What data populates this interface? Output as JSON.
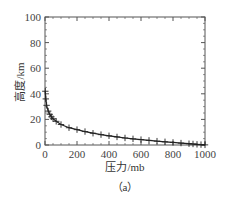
{
  "chart_data": {
    "type": "line",
    "title": "",
    "caption": "（a）",
    "xlabel": "压力/mb",
    "ylabel": "高度/km",
    "xlim": [
      0,
      1000
    ],
    "ylim": [
      0,
      100
    ],
    "xticks": [
      0,
      200,
      400,
      600,
      800,
      1000
    ],
    "yticks": [
      0,
      20,
      40,
      60,
      80,
      100
    ],
    "grid": false,
    "legend": null,
    "marker": "plus",
    "series": [
      {
        "name": "pressure-altitude",
        "color": "#222222",
        "x": [
          2,
          5,
          10,
          20,
          30,
          40,
          50,
          70,
          100,
          150,
          200,
          250,
          300,
          350,
          400,
          450,
          500,
          550,
          600,
          650,
          700,
          750,
          800,
          850,
          900,
          925,
          950,
          975,
          1000
        ],
        "y": [
          42,
          36,
          31,
          26.5,
          24,
          22,
          20.5,
          18.5,
          16,
          13.5,
          12,
          10.5,
          9.2,
          8.1,
          7.2,
          6.3,
          5.5,
          4.8,
          4.2,
          3.6,
          3.0,
          2.5,
          2.0,
          1.5,
          1.0,
          0.8,
          0.5,
          0.3,
          0.1
        ]
      }
    ]
  }
}
